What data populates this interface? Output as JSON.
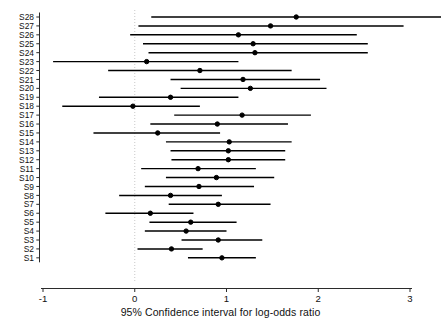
{
  "chart_data": {
    "type": "scatter",
    "title": "",
    "subtitle": "",
    "xlabel": "95% Confidence interval for log-odds ratio",
    "ylabel": "",
    "xlim": [
      -1,
      3
    ],
    "xticks": [
      -1,
      0,
      1,
      2,
      3
    ],
    "xticklabels": [
      "-1",
      "0",
      "1",
      "2",
      "3"
    ],
    "grid": false,
    "legend": null,
    "reference_line": {
      "x": 0,
      "style": "dotted",
      "color": "#c8c8c8"
    },
    "marker": {
      "shape": "circle",
      "fill": "#000000",
      "edge": "#000000",
      "size": 4
    },
    "line_color": "#000000",
    "categories": [
      "S1",
      "S2",
      "S3",
      "S4",
      "S5",
      "S6",
      "S7",
      "S8",
      "S9",
      "S10",
      "S11",
      "S12",
      "S13",
      "S14",
      "S15",
      "S16",
      "S17",
      "S18",
      "S19",
      "S20",
      "S21",
      "S22",
      "S23",
      "S24",
      "S25",
      "S26",
      "S27",
      "S28"
    ],
    "series": [
      {
        "name": "95% Confidence interval for log-odds ratio",
        "points": [
          {
            "label": "S28",
            "estimate": 1.76,
            "lower": 0.18,
            "upper": 3.35
          },
          {
            "label": "S27",
            "estimate": 1.48,
            "lower": 0.04,
            "upper": 2.93
          },
          {
            "label": "S26",
            "estimate": 1.13,
            "lower": -0.05,
            "upper": 2.42
          },
          {
            "label": "S25",
            "estimate": 1.29,
            "lower": 0.09,
            "upper": 2.54
          },
          {
            "label": "S24",
            "estimate": 1.31,
            "lower": 0.15,
            "upper": 2.54
          },
          {
            "label": "S23",
            "estimate": 0.13,
            "lower": -0.89,
            "upper": 1.13
          },
          {
            "label": "S22",
            "estimate": 0.71,
            "lower": -0.29,
            "upper": 1.71
          },
          {
            "label": "S21",
            "estimate": 1.18,
            "lower": 0.39,
            "upper": 2.02
          },
          {
            "label": "S20",
            "estimate": 1.26,
            "lower": 0.5,
            "upper": 2.09
          },
          {
            "label": "S19",
            "estimate": 0.39,
            "lower": -0.39,
            "upper": 1.13
          },
          {
            "label": "S18",
            "estimate": -0.02,
            "lower": -0.79,
            "upper": 0.71
          },
          {
            "label": "S17",
            "estimate": 1.17,
            "lower": 0.43,
            "upper": 1.92
          },
          {
            "label": "S16",
            "estimate": 0.9,
            "lower": 0.17,
            "upper": 1.67
          },
          {
            "label": "S15",
            "estimate": 0.25,
            "lower": -0.45,
            "upper": 0.93
          },
          {
            "label": "S14",
            "estimate": 1.03,
            "lower": 0.34,
            "upper": 1.71
          },
          {
            "label": "S13",
            "estimate": 1.02,
            "lower": 0.39,
            "upper": 1.64
          },
          {
            "label": "S12",
            "estimate": 1.02,
            "lower": 0.4,
            "upper": 1.64
          },
          {
            "label": "S11",
            "estimate": 0.69,
            "lower": 0.07,
            "upper": 1.32
          },
          {
            "label": "S10",
            "estimate": 0.89,
            "lower": 0.34,
            "upper": 1.52
          },
          {
            "label": "S9",
            "estimate": 0.7,
            "lower": 0.11,
            "upper": 1.3
          },
          {
            "label": "S8",
            "estimate": 0.39,
            "lower": -0.17,
            "upper": 0.95
          },
          {
            "label": "S7",
            "estimate": 0.91,
            "lower": 0.37,
            "upper": 1.48
          },
          {
            "label": "S6",
            "estimate": 0.17,
            "lower": -0.32,
            "upper": 0.64
          },
          {
            "label": "S5",
            "estimate": 0.61,
            "lower": 0.16,
            "upper": 1.11
          },
          {
            "label": "S4",
            "estimate": 0.56,
            "lower": 0.11,
            "upper": 1.0
          },
          {
            "label": "S3",
            "estimate": 0.91,
            "lower": 0.51,
            "upper": 1.39
          },
          {
            "label": "S2",
            "estimate": 0.4,
            "lower": 0.03,
            "upper": 0.74
          },
          {
            "label": "S1",
            "estimate": 0.95,
            "lower": 0.58,
            "upper": 1.32
          }
        ]
      }
    ]
  },
  "axis": {
    "x_label": "95% Confidence interval for log-odds ratio",
    "tick_labels": [
      "-1",
      "0",
      "1",
      "2",
      "3"
    ],
    "category_labels": [
      "S28",
      "S27",
      "S26",
      "S25",
      "S24",
      "S23",
      "S22",
      "S21",
      "S20",
      "S19",
      "S18",
      "S17",
      "S16",
      "S15",
      "S14",
      "S13",
      "S12",
      "S11",
      "S10",
      "S9",
      "S8",
      "S7",
      "S6",
      "S5",
      "S4",
      "S3",
      "S2",
      "S1"
    ]
  }
}
